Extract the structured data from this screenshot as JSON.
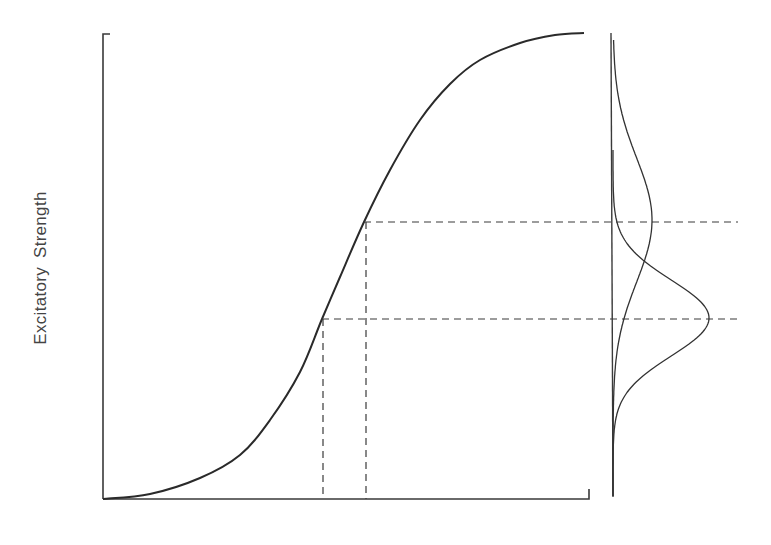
{
  "figure": {
    "ylabel": "Excitatory Strength",
    "xlabel": "",
    "colors": {
      "line": "#2a2a2a",
      "axis": "#3a3a3a",
      "dash": "#3a3a3a",
      "background": "#ffffff"
    }
  },
  "chart_data": {
    "type": "line",
    "title": "",
    "xlabel": "",
    "ylabel": "Excitatory Strength",
    "grid": false,
    "legend": null,
    "axes": {
      "main": {
        "x_pixel_range": [
          103,
          589
        ],
        "y_pixel_range": [
          499,
          34
        ]
      },
      "side_distribution_axis_x": 613
    },
    "series": [
      {
        "name": "sigmoid-response-curve",
        "kind": "sigmoid",
        "description": "S-shaped curve rising from bottom-left to top-right",
        "points_px": [
          [
            103,
            499
          ],
          [
            150,
            494
          ],
          [
            200,
            478
          ],
          [
            240,
            455
          ],
          [
            270,
            420
          ],
          [
            300,
            372
          ],
          [
            322,
            319
          ],
          [
            340,
            277
          ],
          [
            364,
            222
          ],
          [
            390,
            170
          ],
          [
            420,
            120
          ],
          [
            450,
            84
          ],
          [
            480,
            60
          ],
          [
            520,
            43
          ],
          [
            555,
            35
          ],
          [
            584,
            33
          ]
        ]
      },
      {
        "name": "upper-distribution",
        "kind": "gaussian (sideways)",
        "peak_px": [
          652,
          220
        ],
        "baseline_x": 613,
        "spread": "wide"
      },
      {
        "name": "lower-distribution",
        "kind": "gaussian (sideways)",
        "peak_px": [
          709,
          318
        ],
        "baseline_x": 613,
        "spread": "narrow"
      }
    ],
    "annotations": [
      {
        "type": "dashed-horizontal",
        "y_px": 222,
        "x_from": 364,
        "x_to": 738
      },
      {
        "type": "dashed-horizontal",
        "y_px": 319,
        "x_from": 322,
        "x_to": 742
      },
      {
        "type": "dashed-vertical",
        "x_px": 366,
        "y_from": 222,
        "y_to": 499
      },
      {
        "type": "dashed-vertical",
        "x_px": 323,
        "y_from": 319,
        "y_to": 499
      }
    ]
  }
}
